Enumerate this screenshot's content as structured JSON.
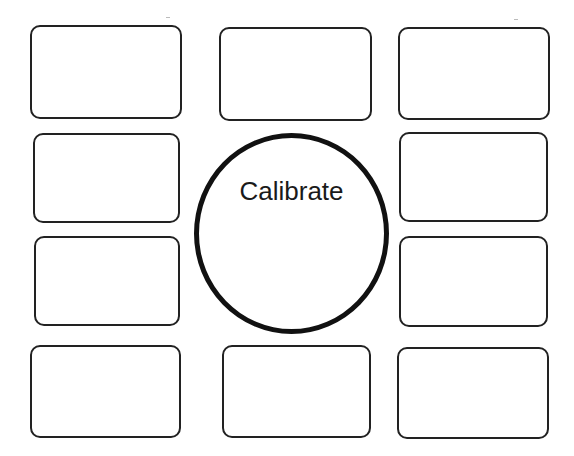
{
  "diagram": {
    "center": {
      "label": "Calibrate",
      "shape": "circle",
      "x": 194,
      "y": 133,
      "w": 195,
      "h": 201,
      "stroke": "#111111"
    },
    "boxes": [
      {
        "id": "top-left",
        "x": 30,
        "y": 25,
        "w": 152,
        "h": 94
      },
      {
        "id": "top-middle",
        "x": 219,
        "y": 27,
        "w": 153,
        "h": 94
      },
      {
        "id": "top-right",
        "x": 398,
        "y": 27,
        "w": 152,
        "h": 93
      },
      {
        "id": "mid-upper-left",
        "x": 33,
        "y": 133,
        "w": 147,
        "h": 90
      },
      {
        "id": "mid-upper-right",
        "x": 399,
        "y": 132,
        "w": 149,
        "h": 90
      },
      {
        "id": "mid-lower-left",
        "x": 34,
        "y": 236,
        "w": 146,
        "h": 90
      },
      {
        "id": "mid-lower-right",
        "x": 399,
        "y": 236,
        "w": 149,
        "h": 91
      },
      {
        "id": "bottom-left",
        "x": 30,
        "y": 345,
        "w": 151,
        "h": 93
      },
      {
        "id": "bottom-middle",
        "x": 222,
        "y": 345,
        "w": 149,
        "h": 93
      },
      {
        "id": "bottom-right",
        "x": 397,
        "y": 347,
        "w": 152,
        "h": 92
      }
    ],
    "box_stroke": "#222222",
    "background": "#ffffff"
  }
}
